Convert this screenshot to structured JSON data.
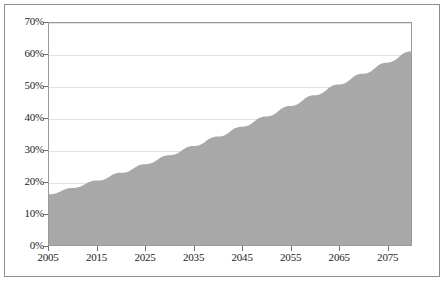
{
  "chart_data": {
    "type": "area",
    "title": "",
    "subtitle": "",
    "xlabel": "",
    "ylabel": "",
    "xlim": [
      2005,
      2080
    ],
    "ylim": [
      0,
      70
    ],
    "grid": true,
    "legend": false,
    "legend_position": "none",
    "fill_color": "#a8a8a8",
    "gridline_color": "#e2e2e2",
    "axis_color": "#9a9a9a",
    "x_tick_labels": [
      "2005",
      "2015",
      "2025",
      "2035",
      "2045",
      "2055",
      "2065",
      "2075"
    ],
    "x_tick_values": [
      2005,
      2015,
      2025,
      2035,
      2045,
      2055,
      2065,
      2075
    ],
    "y_tick_labels": [
      "0%",
      "10%",
      "20%",
      "30%",
      "40%",
      "50%",
      "60%",
      "70%"
    ],
    "y_tick_values": [
      0,
      10,
      20,
      30,
      40,
      50,
      60,
      70
    ],
    "series": [
      {
        "name": "",
        "x": [
          2005,
          2010,
          2015,
          2020,
          2025,
          2030,
          2035,
          2040,
          2045,
          2050,
          2055,
          2060,
          2065,
          2070,
          2075,
          2080
        ],
        "values": [
          16.0,
          18.0,
          20.3,
          22.8,
          25.5,
          28.3,
          31.2,
          34.2,
          37.3,
          40.5,
          43.8,
          47.2,
          50.6,
          54.0,
          57.5,
          61.0
        ]
      }
    ]
  }
}
